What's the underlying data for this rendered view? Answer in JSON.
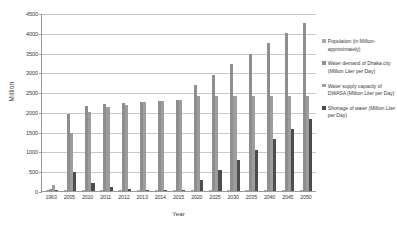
{
  "chart_data": {
    "type": "bar",
    "title": "",
    "xlabel": "Year",
    "ylabel": "Million",
    "ylim": [
      0,
      4500
    ],
    "yticks": [
      0,
      500,
      1000,
      1500,
      2000,
      2500,
      3000,
      3500,
      4000,
      4500
    ],
    "grid": true,
    "legend_position": "right",
    "categories": [
      "1963",
      "2005",
      "2010",
      "2011",
      "2012",
      "2013",
      "2014",
      "2015",
      "2020",
      "2025",
      "2030",
      "2035",
      "2040",
      "2045",
      "2050"
    ],
    "series": [
      {
        "name": "Population (in Million- approximately)",
        "color": "#a8a8a8",
        "values": [
          1,
          11,
          14,
          15,
          15,
          16,
          16,
          17,
          19,
          21,
          23,
          25,
          27,
          29,
          32
        ]
      },
      {
        "name": "Water demand of Dhaka city (Million Liter per Day)",
        "color": "#8e8e8e",
        "values": [
          60,
          1940,
          2160,
          2210,
          2230,
          2250,
          2280,
          2300,
          2680,
          2940,
          3200,
          3460,
          3730,
          3990,
          4250
        ]
      },
      {
        "name": "Water supply capacity of DWASA (Million Liter per Day)",
        "color": "#9d9d9d",
        "values": [
          150,
          1460,
          1990,
          2120,
          2180,
          2250,
          2270,
          2300,
          2400,
          2400,
          2400,
          2400,
          2400,
          2400,
          2400
        ]
      },
      {
        "name": "Shortage of water (Million Liter per Day)",
        "color": "#4d4d4d",
        "values": [
          0,
          480,
          200,
          95,
          55,
          5,
          5,
          5,
          280,
          530,
          780,
          1040,
          1310,
          1560,
          1820
        ]
      }
    ]
  },
  "legend": {
    "items": [
      {
        "label": "Population (in Million- approximately)",
        "color": "#a8a8a8",
        "swatch_name": "legend-swatch-population"
      },
      {
        "label": "Water demand of Dhaka city (Million Liter per Day)",
        "color": "#8e8e8e",
        "swatch_name": "legend-swatch-water-demand"
      },
      {
        "label": "Water supply capacity of DWASA (Million Liter per Day)",
        "color": "#9d9d9d",
        "swatch_name": "legend-swatch-supply-capacity"
      },
      {
        "label": "Shortage of water (Million Liter per Day)",
        "color": "#4d4d4d",
        "swatch_name": "legend-swatch-shortage"
      }
    ]
  }
}
